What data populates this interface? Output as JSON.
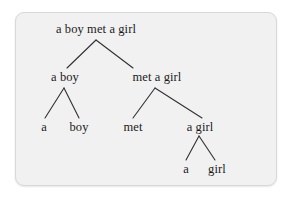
{
  "diagram": {
    "type": "parse-tree",
    "title": "a boy met a girl",
    "panel": {
      "background_color": "#f1f1f1",
      "border_color": "#d8d8d8"
    },
    "text_color": "#1b1b1b",
    "edge_color": "#303030",
    "nodes": [
      {
        "id": "root",
        "label": "a boy met a girl",
        "level": 0,
        "x": 96,
        "y": 30
      },
      {
        "id": "np1",
        "label": "a boy",
        "level": 1,
        "x": 65,
        "y": 78
      },
      {
        "id": "vp",
        "label": "met a girl",
        "level": 1,
        "x": 157,
        "y": 78
      },
      {
        "id": "det1",
        "label": "a",
        "level": 2,
        "x": 44,
        "y": 128
      },
      {
        "id": "n1",
        "label": "boy",
        "level": 2,
        "x": 79,
        "y": 128
      },
      {
        "id": "v",
        "label": "met",
        "level": 2,
        "x": 133,
        "y": 128
      },
      {
        "id": "np2",
        "label": "a girl",
        "level": 2,
        "x": 200,
        "y": 128
      },
      {
        "id": "det2",
        "label": "a",
        "level": 3,
        "x": 186,
        "y": 170
      },
      {
        "id": "n2",
        "label": "girl",
        "level": 3,
        "x": 217,
        "y": 170
      }
    ],
    "edges": [
      {
        "from": "root",
        "to": "np1",
        "x1": 96,
        "y1": 40,
        "x2": 67,
        "y2": 68
      },
      {
        "from": "root",
        "to": "vp",
        "x1": 96,
        "y1": 40,
        "x2": 133,
        "y2": 68
      },
      {
        "from": "np1",
        "to": "det1",
        "x1": 64,
        "y1": 88,
        "x2": 45,
        "y2": 118
      },
      {
        "from": "np1",
        "to": "n1",
        "x1": 64,
        "y1": 88,
        "x2": 79,
        "y2": 118
      },
      {
        "from": "vp",
        "to": "v",
        "x1": 155,
        "y1": 88,
        "x2": 133,
        "y2": 118
      },
      {
        "from": "vp",
        "to": "np2",
        "x1": 155,
        "y1": 88,
        "x2": 202,
        "y2": 118
      },
      {
        "from": "np2",
        "to": "det2",
        "x1": 199,
        "y1": 136,
        "x2": 186,
        "y2": 160
      },
      {
        "from": "np2",
        "to": "n2",
        "x1": 199,
        "y1": 136,
        "x2": 215,
        "y2": 160
      }
    ]
  }
}
